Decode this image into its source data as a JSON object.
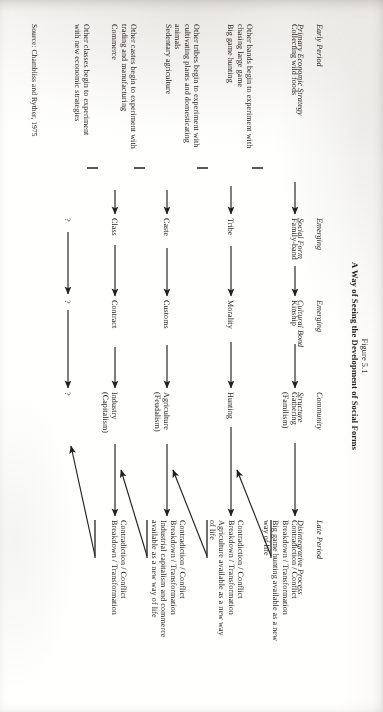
{
  "figure": {
    "number": "Figure 5.1",
    "title": "A Way of Seeing the Development of Social Forms",
    "source": "Source: Chambliss and Ryther, 1975"
  },
  "columns": [
    {
      "id": "early-period",
      "line1": "Early Period",
      "line2": "Primary Economic Strategy"
    },
    {
      "id": "emerging-social",
      "line1": "Emerging",
      "line2": "Social Form"
    },
    {
      "id": "emerging-cultural",
      "line1": "Emerging",
      "line2": "Cultural Bond"
    },
    {
      "id": "community",
      "line1": "Community",
      "line2": "Structure"
    },
    {
      "id": "late-period",
      "line1": "Late Period",
      "line2": "Disintegrative Process"
    }
  ],
  "rows": [
    {
      "id": "row-collecting",
      "strategy": "Collecting wild foods",
      "social_form": "Family-band",
      "cultural_bond": "Kinship",
      "community": "Gathering\n(Familism)",
      "disintegrative": "Contradiction / Conflict\nBreakdown / Transformation\nBig game hunting available as a new\nway of life"
    },
    {
      "id": "row-big-game",
      "strategy": "Other bands begin to experiment with\nchasing large game\nBig game hunting",
      "social_form": "Tribe",
      "cultural_bond": "Morality",
      "community": "Hunting",
      "disintegrative": "Contradiction / Conflict\nBreakdown / Transformation\nAgriculture available as a new way\nof life"
    },
    {
      "id": "row-agriculture",
      "strategy": "Other tribes begin to experiment with\ncultivating plants and domesticating\nanimals\nSedentary agriculture",
      "social_form": "Caste",
      "cultural_bond": "Customs",
      "community": "Agriculture\n(Feudalism)",
      "disintegrative": "Contradiction / Conflict\nBreakdown / Transformation\nIndustrial capitalism and commerce\navailable as a new way of life"
    },
    {
      "id": "row-commerce",
      "strategy": "Other castes begin to experiment with\ntrading and manufacturing\nCommerce",
      "social_form": "Class",
      "cultural_bond": "Contract",
      "community": "Industry\n(Capitalism)",
      "disintegrative": "Contradiction / Conflict\nBreakdown / Transformation"
    },
    {
      "id": "row-unknown",
      "strategy": "Other classes begin to experiment\nwith new economic strategies",
      "social_form": "?",
      "cultural_bond": "?",
      "community": "?",
      "disintegrative": ""
    }
  ],
  "colors": {
    "ink": "#231f1d",
    "paper": "#fdfdfc"
  }
}
